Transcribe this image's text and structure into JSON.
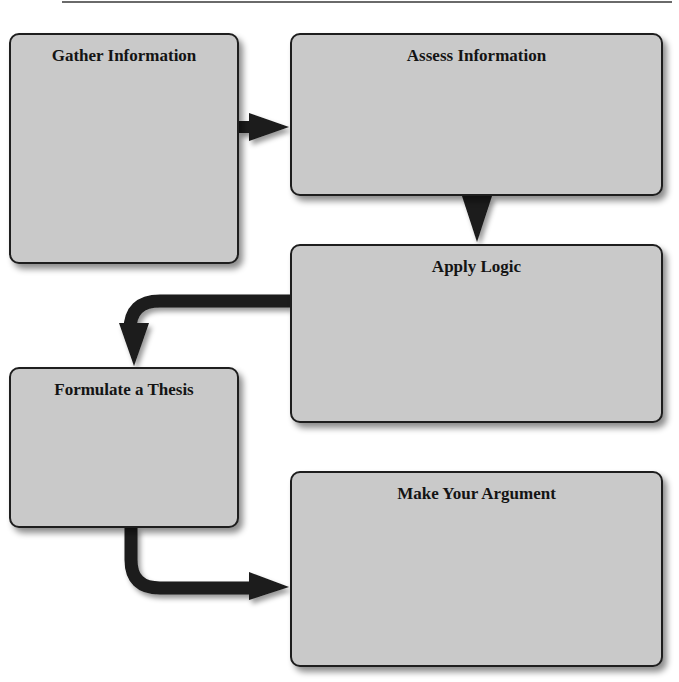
{
  "header": {
    "cut_off_label": ""
  },
  "flowchart": {
    "steps": [
      {
        "id": "gather",
        "title": "Gather Information"
      },
      {
        "id": "assess",
        "title": "Assess Information"
      },
      {
        "id": "apply",
        "title": "Apply Logic"
      },
      {
        "id": "thesis",
        "title": "Formulate a Thesis"
      },
      {
        "id": "argue",
        "title": "Make Your Argument"
      }
    ],
    "connections": [
      {
        "from": "gather",
        "to": "assess",
        "direction": "right"
      },
      {
        "from": "assess",
        "to": "apply",
        "direction": "down"
      },
      {
        "from": "apply",
        "to": "thesis",
        "direction": "left-then-down"
      },
      {
        "from": "thesis",
        "to": "argue",
        "direction": "down-then-right"
      }
    ],
    "colors": {
      "box_fill": "#c9c9c9",
      "box_border": "#1e1e1e",
      "arrow": "#1a1a1a"
    }
  }
}
